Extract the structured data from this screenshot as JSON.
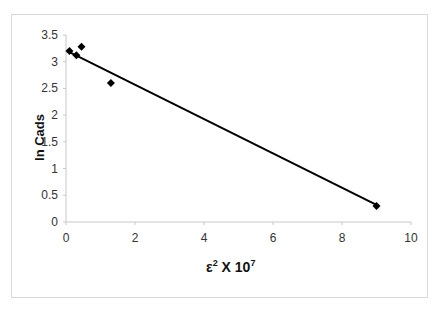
{
  "chart_data": {
    "type": "scatter",
    "title": "",
    "xlabel": "ε² X 10⁷",
    "xlabel_base": "ε",
    "xlabel_sup": "2",
    "xlabel_mid": " X 10",
    "xlabel_sup2": "7",
    "ylabel": "ln Cads",
    "xlim": [
      0,
      10
    ],
    "ylim": [
      0,
      3.5
    ],
    "x_ticks": [
      "0",
      "2",
      "4",
      "6",
      "8",
      "10"
    ],
    "y_ticks": [
      "0",
      "0.5",
      "1",
      "1.5",
      "2",
      "2.5",
      "3",
      "3.5"
    ],
    "grid": false,
    "legend": null,
    "series": [
      {
        "name": "data",
        "marker": "diamond",
        "points": [
          {
            "x": 0.1,
            "y": 3.2
          },
          {
            "x": 0.3,
            "y": 3.12
          },
          {
            "x": 0.45,
            "y": 3.28
          },
          {
            "x": 1.3,
            "y": 2.6
          },
          {
            "x": 9.0,
            "y": 0.3
          }
        ]
      }
    ],
    "trendline": {
      "type": "linear",
      "x0": 0.1,
      "y0": 3.18,
      "x1": 9.0,
      "y1": 0.32
    }
  }
}
